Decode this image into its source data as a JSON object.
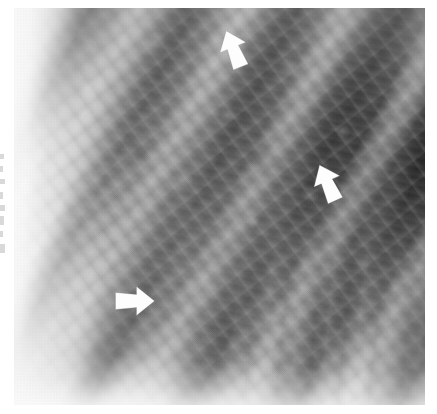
{
  "figure": {
    "kind": "radiograph-detail",
    "modality": "chest-radiograph",
    "region": "right mid and lower lung zones",
    "orientation": "ribs course obliquely from lower-left to upper-right",
    "background_color": "#ffffff",
    "plate": {
      "left": 14,
      "top": 8,
      "width": 411,
      "height": 397,
      "base_tone": "#8e8e8e",
      "bright_tone": "#ffffff",
      "dark_tone": "#161616"
    }
  },
  "annotations": {
    "arrow_color": "#fdfdfd",
    "arrow_count": 3,
    "arrows": [
      {
        "id": "arrow-upper",
        "label": "upper arrow",
        "points_to": "upper lung zone opacity",
        "direction": "up-left",
        "rotation_deg": -22,
        "x": 216,
        "y": 28,
        "width": 34,
        "height": 42
      },
      {
        "id": "arrow-right",
        "label": "right arrow",
        "points_to": "lateral mid-zone opacity",
        "direction": "up-left",
        "rotation_deg": -24,
        "x": 310,
        "y": 162,
        "width": 34,
        "height": 42
      },
      {
        "id": "arrow-lower",
        "label": "lower arrow",
        "points_to": "lower zone reticular opacity",
        "direction": "right",
        "rotation_deg": 0,
        "x": 112,
        "y": 284,
        "width": 44,
        "height": 34
      }
    ]
  },
  "margin_marks": {
    "description": "faint cut-off text fragments at the extreme left page margin",
    "color": "#b9b9b9",
    "fragments": [
      {
        "top": 2,
        "width": 4,
        "height": 5
      },
      {
        "top": 14,
        "width": 3,
        "height": 6
      },
      {
        "top": 27,
        "width": 5,
        "height": 5
      },
      {
        "top": 40,
        "width": 3,
        "height": 7
      },
      {
        "top": 53,
        "width": 5,
        "height": 6
      },
      {
        "top": 64,
        "width": 4,
        "height": 9
      },
      {
        "top": 79,
        "width": 3,
        "height": 6
      },
      {
        "top": 92,
        "width": 5,
        "height": 9
      }
    ]
  }
}
